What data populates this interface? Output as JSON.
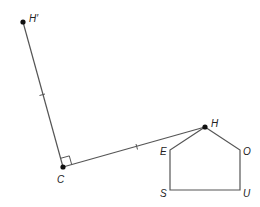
{
  "diagram": {
    "type": "geometry-construction",
    "points": {
      "H_prime": {
        "label": "H′",
        "x": 23,
        "y": 22
      },
      "C": {
        "label": "C",
        "x": 63,
        "y": 167
      },
      "H": {
        "label": "H",
        "x": 205,
        "y": 127
      },
      "E": {
        "label": "E",
        "x": 170,
        "y": 150
      },
      "O": {
        "label": "O",
        "x": 240,
        "y": 150
      },
      "S": {
        "label": "S",
        "x": 170,
        "y": 190
      },
      "U": {
        "label": "U",
        "x": 240,
        "y": 190
      }
    },
    "segments": [
      {
        "from": "H_prime",
        "to": "C",
        "tick": true
      },
      {
        "from": "C",
        "to": "H",
        "tick": true
      }
    ],
    "polygon": {
      "name": "HOUSE",
      "vertices": [
        "H",
        "O",
        "U",
        "S",
        "E"
      ]
    },
    "right_angle_at": "C",
    "colors": {
      "line": "#555555",
      "point": "#111111"
    }
  }
}
